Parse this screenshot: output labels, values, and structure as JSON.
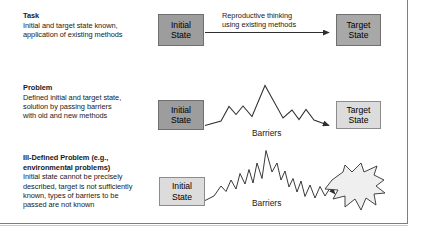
{
  "figure": {
    "kind": "problem-taxonomy-diagram",
    "frame": {
      "right_rule": true,
      "bottom_rule": true
    }
  },
  "colors": {
    "initial_state_fill_dark": "#9d9d9d",
    "target_state_fill_dark": "#a8a8a8",
    "light_fill": "#dcdcdc",
    "stroke": "#3a3a3a",
    "text": "#1a1a1a"
  },
  "rows": [
    {
      "id": "task",
      "title": "Task",
      "description_lines": [
        "Initial and target state known,",
        "application of existing methods"
      ],
      "initial_state": {
        "line1": "Initial",
        "line2": "State",
        "shade": "dark"
      },
      "target_state": {
        "line1": "Target",
        "line2": "State",
        "shade": "dark",
        "shape": "rectangle"
      },
      "connector": {
        "type": "straight-arrow"
      },
      "connector_label_lines": [
        "Reproductive thinking",
        "using existing methods"
      ],
      "barrier_label": ""
    },
    {
      "id": "problem",
      "title": "Problem",
      "description_lines": [
        "Defined initial and target state,",
        "solution by passing barriers",
        "with old and new methods"
      ],
      "initial_state": {
        "line1": "Initial",
        "line2": "State",
        "shade": "dark"
      },
      "target_state": {
        "line1": "Target",
        "line2": "State",
        "shade": "light",
        "shape": "rectangle"
      },
      "connector": {
        "type": "smooth-mountain-arrow"
      },
      "connector_label_lines": [],
      "barrier_label": "Barriers"
    },
    {
      "id": "ill-defined-problem",
      "title_lines": [
        "Ill-Defined Problem (e.g.,",
        "environmental problems)"
      ],
      "title": "Ill-Defined Problem (e.g., environmental problems)",
      "description_lines": [
        "Initial state cannot be precisely",
        "described, target is not sufficiently",
        "known, types of barriers to be",
        "passed are not known"
      ],
      "initial_state": {
        "line1": "Initial",
        "line2": "State",
        "shade": "light"
      },
      "target_state": {
        "line1": "Target",
        "line2": "State",
        "shade": "light",
        "shape": "starburst"
      },
      "connector": {
        "type": "jagged-mountain-arrow"
      },
      "connector_label_lines": [],
      "barrier_label": "Barriers"
    }
  ]
}
